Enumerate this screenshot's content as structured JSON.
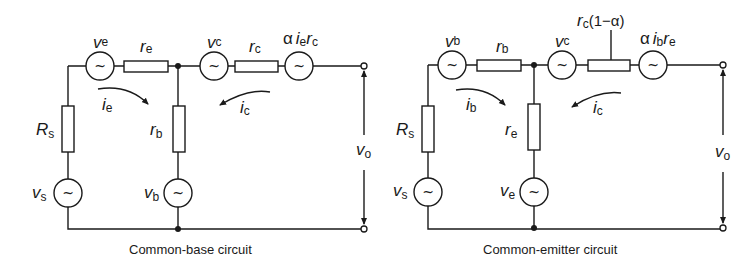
{
  "figure": {
    "left": {
      "caption": "Common-base circuit",
      "labels": {
        "ve": {
          "main": "v",
          "sub": "e"
        },
        "re": {
          "main": "r",
          "sub": "e"
        },
        "vc": {
          "main": "v",
          "sub": "c"
        },
        "rc": {
          "main": "r",
          "sub": "c"
        },
        "dep_source": {
          "alpha": "α",
          "i": "i",
          "i_sub": "e",
          "r": "r",
          "r_sub": "c"
        },
        "ie": {
          "main": "i",
          "sub": "e"
        },
        "ic": {
          "main": "i",
          "sub": "c"
        },
        "Rs": {
          "main": "R",
          "sub": "s"
        },
        "rb": {
          "main": "r",
          "sub": "b"
        },
        "vs": {
          "main": "v",
          "sub": "s"
        },
        "vb": {
          "main": "v",
          "sub": "b"
        },
        "vo": {
          "main": "v",
          "sub": "o"
        }
      }
    },
    "right": {
      "caption": "Common-emitter circuit",
      "labels": {
        "vb": {
          "main": "v",
          "sub": "b"
        },
        "rb": {
          "main": "r",
          "sub": "b"
        },
        "vc": {
          "main": "v",
          "sub": "c"
        },
        "rc_alpha": {
          "r": "r",
          "r_sub": "c",
          "factor": "(1−α)"
        },
        "dep_source": {
          "alpha": "α",
          "i": "i",
          "i_sub": "b",
          "r": "r",
          "r_sub": "e"
        },
        "ib": {
          "main": "i",
          "sub": "b"
        },
        "ic": {
          "main": "i",
          "sub": "c"
        },
        "Rs": {
          "main": "R",
          "sub": "s"
        },
        "re": {
          "main": "r",
          "sub": "e"
        },
        "vs": {
          "main": "v",
          "sub": "s"
        },
        "ve": {
          "main": "v",
          "sub": "e"
        },
        "vo": {
          "main": "v",
          "sub": "o"
        }
      }
    },
    "source_symbol": "~"
  }
}
